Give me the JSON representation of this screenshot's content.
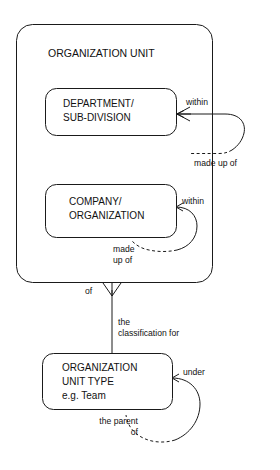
{
  "diagram": {
    "type": "entity-relationship-diagram",
    "notation": "crows-foot",
    "background_color": "#ffffff",
    "line_color": "#1a1a1a",
    "text_color": "#111111",
    "entities": [
      {
        "id": "organization-unit",
        "label": "ORGANIZATION UNIT",
        "role": "supertype-container"
      },
      {
        "id": "department-sub-division",
        "label_line1": "DEPARTMENT/",
        "label_line2": "SUB-DIVISION",
        "role": "subtype"
      },
      {
        "id": "company-organization",
        "label_line1": "COMPANY/",
        "label_line2": "ORGANIZATION",
        "role": "subtype"
      },
      {
        "id": "organization-unit-type",
        "label_line1": "ORGANIZATION",
        "label_line2": "UNIT TYPE",
        "label_line3": "e.g. Team",
        "role": "type-entity"
      }
    ],
    "relationships": [
      {
        "id": "department-recursive",
        "from": "department-sub-division",
        "to": "department-sub-division",
        "label_near": "within",
        "label_far": "made up of",
        "far_line_style": "dashed"
      },
      {
        "id": "company-recursive",
        "from": "company-organization",
        "to": "company-organization",
        "label_near": "within",
        "label_far_line1": "made",
        "label_far_line2": "up of",
        "far_line_style": "dashed"
      },
      {
        "id": "unit-classified-by-type",
        "from": "organization-unit",
        "to": "organization-unit-type",
        "label_near": "of",
        "label_far_line1": "the",
        "label_far_line2": "classification for"
      },
      {
        "id": "unit-type-recursive",
        "from": "organization-unit-type",
        "to": "organization-unit-type",
        "label_near": "under",
        "label_far_line1": "the parent",
        "label_far_line2": "of",
        "far_line_style": "dashed"
      }
    ]
  }
}
